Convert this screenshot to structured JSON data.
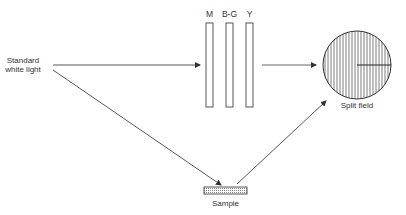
{
  "diagram": {
    "source": {
      "label_line1": "Standard",
      "label_line2": "white light"
    },
    "filters": [
      {
        "label": "M"
      },
      {
        "label": "B-G"
      },
      {
        "label": "Y"
      }
    ],
    "split_field": {
      "label": "Split field"
    },
    "sample": {
      "label": "Sample"
    },
    "colors": {
      "line": "#333333",
      "background": "#ffffff",
      "sample_fill": "#dddddd"
    }
  }
}
